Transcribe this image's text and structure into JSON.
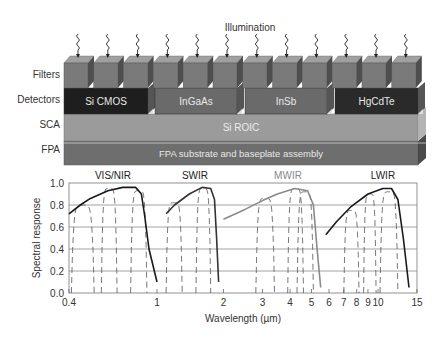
{
  "diagram": {
    "illumination_label": "Illumination",
    "row_labels": {
      "filters": "Filters",
      "detectors": "Detectors",
      "sca": "SCA",
      "fpa": "FPA"
    },
    "detectors": [
      {
        "label": "Si CMOS",
        "color": "#1e1e1e"
      },
      {
        "label": "InGaAs",
        "color": "#6a6a6a"
      },
      {
        "label": "InSb",
        "color": "#6a6a6a"
      },
      {
        "label": "HgCdTe",
        "color": "#2a2a2a"
      }
    ],
    "sca_label": "Si ROIC",
    "fpa_label": "FPA substrate and baseplate assembly",
    "filter_count": 12,
    "colors": {
      "filter_front": "#7a7a7a",
      "filter_top": "#9a9a9a",
      "filter_side": "#4e4e4e",
      "sca": "#9b9b9b",
      "fpa": "#6e6e6e",
      "text_light": "#e8e8e8"
    }
  },
  "chart_data": {
    "type": "line",
    "title": "",
    "xlabel": "Wavelength (µm)",
    "ylabel": "Spectral response",
    "xscale": "log",
    "xlim": [
      0.4,
      15
    ],
    "ylim": [
      0.0,
      1.0
    ],
    "grid": true,
    "x_ticks": [
      "0.4",
      "1",
      "2",
      "3",
      "4",
      "5",
      "6",
      "7",
      "8",
      "9",
      "10",
      "15"
    ],
    "y_ticks": [
      "0.0",
      "0.2",
      "0.4",
      "0.6",
      "0.8",
      "1.0"
    ],
    "band_labels": [
      {
        "label": "VIS/NIR",
        "color": "#222222"
      },
      {
        "label": "SWIR",
        "color": "#222222"
      },
      {
        "label": "MWIR",
        "color": "#888888"
      },
      {
        "label": "LWIR",
        "color": "#222222"
      }
    ],
    "series": [
      {
        "name": "VIS/NIR (Si CMOS) envelope",
        "style": "solid",
        "color": "#1a1a1a",
        "x": [
          0.4,
          0.45,
          0.5,
          0.6,
          0.7,
          0.8,
          0.85,
          0.88,
          0.92,
          1.0
        ],
        "y": [
          0.72,
          0.8,
          0.86,
          0.93,
          0.96,
          0.96,
          0.9,
          0.7,
          0.4,
          0.1
        ]
      },
      {
        "name": "SWIR (InGaAs) envelope",
        "style": "solid",
        "color": "#333333",
        "x": [
          1.1,
          1.2,
          1.4,
          1.6,
          1.75,
          1.82,
          1.86,
          1.9
        ],
        "y": [
          0.72,
          0.8,
          0.9,
          0.96,
          0.95,
          0.85,
          0.5,
          0.1
        ]
      },
      {
        "name": "MWIR (InSb) envelope",
        "style": "solid",
        "color": "#8a8a8a",
        "x": [
          2.0,
          2.5,
          3.0,
          3.5,
          4.2,
          4.8,
          5.1,
          5.3,
          5.5
        ],
        "y": [
          0.67,
          0.76,
          0.84,
          0.9,
          0.95,
          0.93,
          0.8,
          0.4,
          0.05
        ]
      },
      {
        "name": "LWIR (HgCdTe) envelope",
        "style": "solid",
        "color": "#1a1a1a",
        "x": [
          5.8,
          6.5,
          7.5,
          9.0,
          10.5,
          11.5,
          12.3,
          13.0,
          13.8
        ],
        "y": [
          0.53,
          0.65,
          0.78,
          0.9,
          0.95,
          0.95,
          0.85,
          0.5,
          0.05
        ]
      }
    ]
  }
}
